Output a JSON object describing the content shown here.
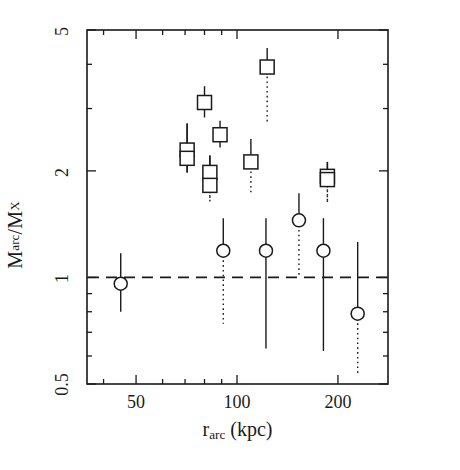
{
  "chart_data": {
    "type": "scatter",
    "title": "",
    "xlabel": "r_arc (kpc)",
    "ylabel": "M_arc/M_X",
    "xscale": "log",
    "yscale": "log",
    "xlim": [
      35.7,
      282
    ],
    "ylim": [
      0.5,
      5
    ],
    "grid": false,
    "legend": null,
    "xticks": [
      50,
      100,
      200
    ],
    "xtick_labels": [
      "50",
      "100",
      "200"
    ],
    "yticks": [
      0.5,
      1,
      2,
      5
    ],
    "ytick_labels": [
      "0.5",
      "1",
      "2",
      "5"
    ],
    "annotations": [
      {
        "type": "hline",
        "y": 1.0,
        "style": "dashed",
        "label": "M_arc/M_X = 1"
      }
    ],
    "series": [
      {
        "name": "squares",
        "marker": "open-square",
        "points": [
          {
            "x": 71,
            "y": 2.29,
            "ylow": 1.98,
            "yhigh": 2.72,
            "low_style": "solid"
          },
          {
            "x": 71,
            "y": 2.17,
            "ylow": 1.98,
            "yhigh": 2.72,
            "low_style": "solid"
          },
          {
            "x": 80,
            "y": 3.12,
            "ylow": 2.83,
            "yhigh": 3.47,
            "low_style": "solid"
          },
          {
            "x": 83,
            "y": 1.98,
            "ylow": 1.64,
            "yhigh": 2.21,
            "low_style": "dotted"
          },
          {
            "x": 83,
            "y": 1.82,
            "ylow": 1.64,
            "yhigh": 2.21,
            "low_style": "dotted"
          },
          {
            "x": 89,
            "y": 2.53,
            "ylow": 2.33,
            "yhigh": 2.77,
            "low_style": "solid"
          },
          {
            "x": 110,
            "y": 2.12,
            "ylow": 1.72,
            "yhigh": 2.46,
            "low_style": "dotted"
          },
          {
            "x": 123,
            "y": 3.93,
            "ylow": 2.72,
            "yhigh": 4.45,
            "low_style": "dotted"
          },
          {
            "x": 186,
            "y": 1.93,
            "ylow": 1.62,
            "yhigh": 2.12,
            "low_style": "dotted"
          },
          {
            "x": 186,
            "y": 1.89,
            "ylow": 1.62,
            "yhigh": 2.12,
            "low_style": "dotted"
          }
        ]
      },
      {
        "name": "circles",
        "marker": "open-circle",
        "points": [
          {
            "x": 45,
            "y": 0.96,
            "ylow": 0.8,
            "yhigh": 1.17,
            "low_style": "solid"
          },
          {
            "x": 91,
            "y": 1.19,
            "ylow": 0.74,
            "yhigh": 1.47,
            "low_style": "dotted"
          },
          {
            "x": 122,
            "y": 1.19,
            "ylow": 0.63,
            "yhigh": 1.47,
            "low_style": "solid"
          },
          {
            "x": 153,
            "y": 1.45,
            "ylow": 1.0,
            "yhigh": 1.73,
            "low_style": "dotted"
          },
          {
            "x": 181,
            "y": 1.19,
            "ylow": 0.62,
            "yhigh": 1.47,
            "low_style": "solid"
          },
          {
            "x": 229,
            "y": 0.79,
            "ylow": 0.53,
            "yhigh": 1.26,
            "low_style": "dotted"
          }
        ]
      }
    ]
  },
  "axis": {
    "ylabel_parts": {
      "m1": "M",
      "sub1": "arc",
      "slash": "/",
      "m2": "M",
      "sub2": "X"
    },
    "xlabel_parts": {
      "r": "r",
      "sub": "arc",
      "unit": " (kpc)"
    }
  }
}
